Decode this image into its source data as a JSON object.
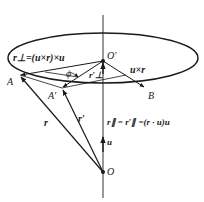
{
  "diagram": {
    "type": "vector-rotation-geometry",
    "colors": {
      "stroke": "#1a1a1a",
      "axis": "#333333",
      "background": "#ffffff"
    },
    "points": {
      "O": {
        "label": "O",
        "x": 103,
        "y": 172
      },
      "O_prime": {
        "label": "O′",
        "x": 103,
        "y": 61
      },
      "A": {
        "label": "A",
        "x": 20,
        "y": 75
      },
      "A_prime": {
        "label": "A′",
        "x": 62,
        "y": 88
      },
      "B": {
        "label": "B",
        "x": 145,
        "y": 88
      }
    },
    "labels": {
      "r_perp_eq": "r⊥=(u×r)×u",
      "u_cross_r": "u×r",
      "r_perp_prime": "r′⊥",
      "phi": "ϕ",
      "r": "r",
      "r_prime": "r′",
      "r_parallel_eq": "r∥ = r′∥ =(r · u)u",
      "u": "u"
    }
  }
}
